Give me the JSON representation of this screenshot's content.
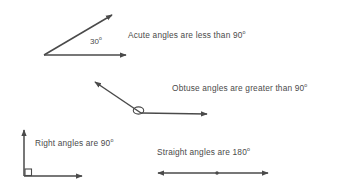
{
  "page": {
    "background_color": "#ffffff",
    "ink_color": "#4a4a4a",
    "width": 349,
    "height": 191
  },
  "labels": {
    "acute": "Acute angles are less than 90",
    "obtuse": "Obtuse angles are greater than 90",
    "right": "Right angles are 90",
    "straight": "Straight angles are 180",
    "degree_symbol": "o",
    "acute_measure": "30",
    "acute_measure_unit": "o"
  },
  "figures": [
    {
      "name": "acute-angle",
      "type": "angle",
      "measure_degrees": 30,
      "vertex": [
        44,
        55
      ],
      "rays": [
        {
          "name": "horizontal-ray",
          "to": [
            126,
            55
          ]
        },
        {
          "name": "diagonal-ray",
          "to": [
            112,
            15
          ]
        }
      ],
      "marker": "none"
    },
    {
      "name": "obtuse-angle",
      "type": "angle",
      "measure_degrees": 145,
      "vertex": [
        141,
        113
      ],
      "rays": [
        {
          "name": "horizontal-ray",
          "to": [
            207,
            114
          ]
        },
        {
          "name": "diagonal-ray",
          "to": [
            95,
            82
          ]
        }
      ],
      "marker": "arc"
    },
    {
      "name": "right-angle",
      "type": "angle",
      "measure_degrees": 90,
      "vertex": [
        24,
        176
      ],
      "rays": [
        {
          "name": "horizontal-ray",
          "to": [
            82,
            176
          ]
        },
        {
          "name": "vertical-ray",
          "to": [
            24,
            130
          ]
        }
      ],
      "marker": "square"
    },
    {
      "name": "straight-angle",
      "type": "angle",
      "measure_degrees": 180,
      "vertex": [
        217,
        173
      ],
      "rays": [
        {
          "name": "left-ray",
          "to": [
            158,
            173
          ]
        },
        {
          "name": "right-ray",
          "to": [
            268,
            173
          ]
        }
      ],
      "marker": "point"
    }
  ]
}
